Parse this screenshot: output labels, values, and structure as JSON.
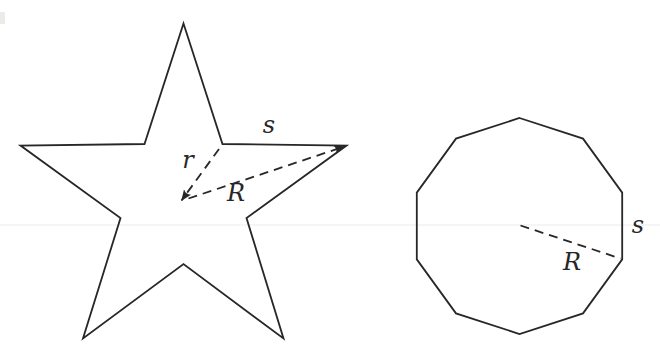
{
  "page": {
    "background": "#ffffff",
    "width": 660,
    "height": 357
  },
  "stroke": {
    "color": "#272727",
    "width": 1.8,
    "dash": "9 6"
  },
  "labels_font_size": 24,
  "artifacts": {
    "faint_rule_y": 225,
    "faint_rule_color": "#ececec",
    "edge_speck": {
      "x": 0,
      "y": 12,
      "w": 5,
      "h": 12,
      "color": "#edebe8"
    }
  },
  "figures": [
    {
      "name": "pentagram-star",
      "outline": [
        [
          183.5,
          23.5
        ],
        [
          222.5,
          144.0
        ],
        [
          346.5,
          145.5
        ],
        [
          246.5,
          218.0
        ],
        [
          283.5,
          338.5
        ],
        [
          183.5,
          264.0
        ],
        [
          83.0,
          338.5
        ],
        [
          120.5,
          218.0
        ],
        [
          20.5,
          145.5
        ],
        [
          144.5,
          144.0
        ]
      ],
      "dashed_lines": [
        {
          "name": "inner-radius-line",
          "from": [
            219.0,
            149.0
          ],
          "to": [
            181.5,
            200.5
          ],
          "arrow_end": true
        },
        {
          "name": "circumradius-line",
          "from": [
            188.5,
            198.5
          ],
          "to": [
            344.5,
            146.5
          ],
          "arrow_end": true
        }
      ],
      "labels": [
        {
          "name": "side-length-label",
          "text": "s",
          "x": 269,
          "y": 133
        },
        {
          "name": "inner-radius-label",
          "text": "r",
          "x": 188,
          "y": 168
        },
        {
          "name": "circumradius-label",
          "text": "R",
          "x": 236,
          "y": 201
        }
      ]
    },
    {
      "name": "regular-decagon",
      "outline": [
        [
          519.5,
          118.0
        ],
        [
          583.0,
          138.6
        ],
        [
          622.2,
          192.6
        ],
        [
          622.2,
          259.4
        ],
        [
          583.0,
          313.4
        ],
        [
          519.5,
          334.0
        ],
        [
          456.0,
          313.4
        ],
        [
          416.8,
          259.4
        ],
        [
          416.8,
          192.6
        ],
        [
          456.0,
          138.6
        ]
      ],
      "dashed_lines": [
        {
          "name": "circumradius-line",
          "from": [
            520.5,
            225.5
          ],
          "to": [
            620.5,
            258.5
          ],
          "arrow_end": false
        }
      ],
      "labels": [
        {
          "name": "circumradius-label",
          "text": "R",
          "x": 572,
          "y": 270
        },
        {
          "name": "side-length-label",
          "text": "s",
          "x": 638,
          "y": 233
        }
      ]
    }
  ]
}
